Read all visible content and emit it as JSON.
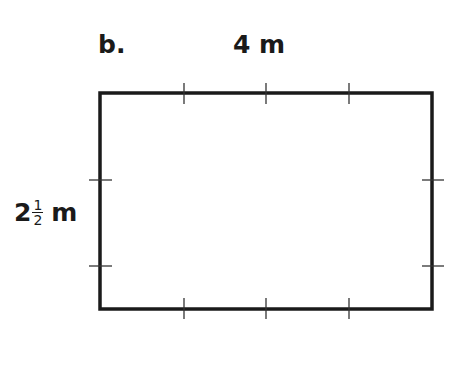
{
  "figure": {
    "part_label": "b.",
    "top_dimension": "4 m",
    "side_dimension": {
      "whole": "2",
      "numerator": "1",
      "denominator": "2",
      "unit": "m"
    }
  },
  "shape": {
    "type": "rectangle",
    "x": 100,
    "y": 93,
    "width": 332,
    "height": 216,
    "stroke": "#1a1a1a",
    "horizontal_ticks": [
      184,
      266,
      349
    ],
    "vertical_ticks": [
      180,
      266
    ]
  }
}
